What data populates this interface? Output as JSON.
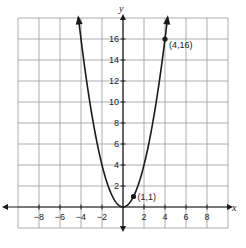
{
  "chart_data": {
    "type": "line",
    "title": "",
    "function": "y = x^2",
    "xlabel": "x",
    "ylabel": "y",
    "xlim": [
      -10,
      10
    ],
    "ylim": [
      -2,
      18
    ],
    "grid": true,
    "grid_step": 2,
    "x_ticks": [
      -8,
      -6,
      -4,
      -2,
      2,
      4,
      6,
      8
    ],
    "y_ticks": [
      2,
      4,
      6,
      8,
      10,
      12,
      14,
      16
    ],
    "series": [
      {
        "name": "parabola",
        "x": [
          -4.2,
          -4,
          -3,
          -2,
          -1,
          0,
          1,
          2,
          3,
          4,
          4.2
        ],
        "y": [
          17.64,
          16,
          9,
          4,
          1,
          0,
          1,
          4,
          9,
          16,
          17.64
        ]
      }
    ],
    "points": [
      {
        "x": 1,
        "y": 1,
        "label": "(1,1)"
      },
      {
        "x": 4,
        "y": 16,
        "label": "(4,16)"
      }
    ],
    "colors": {
      "curve": "#1a1a1a",
      "grid": "#9a9a9a",
      "axis": "#1a1a1a"
    }
  }
}
